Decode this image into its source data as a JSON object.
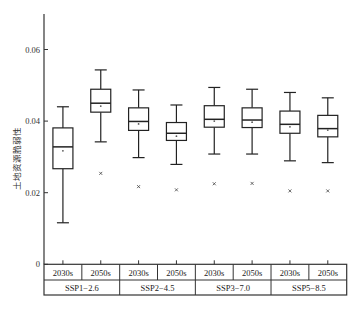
{
  "chart_data": {
    "type": "boxplot",
    "title": "",
    "xlabel": "",
    "ylabel": "土地资源脆弱性",
    "ylim": [
      0,
      0.07
    ],
    "yticks": [
      0,
      0.02,
      0.04,
      0.06
    ],
    "ytick_labels": [
      "0",
      "0.02",
      "0.04",
      "0.06"
    ],
    "grid": false,
    "legend": null,
    "groups": [
      "SSP1−2.6",
      "SSP2−4.5",
      "SSP3−7.0",
      "SSP5−8.5"
    ],
    "periods": [
      "2030s",
      "2050s"
    ],
    "boxes": [
      {
        "group": "SSP1−2.6",
        "period": "2030s",
        "min": 0.0116,
        "q1": 0.0267,
        "median": 0.0328,
        "mean": 0.0317,
        "q3": 0.0381,
        "max": 0.044,
        "outliers": []
      },
      {
        "group": "SSP1−2.6",
        "period": "2050s",
        "min": 0.0342,
        "q1": 0.0425,
        "median": 0.045,
        "mean": 0.0442,
        "q3": 0.0489,
        "max": 0.0543,
        "outliers": [
          0.0254
        ]
      },
      {
        "group": "SSP2−4.5",
        "period": "2030s",
        "min": 0.0298,
        "q1": 0.0374,
        "median": 0.0399,
        "mean": 0.0392,
        "q3": 0.0437,
        "max": 0.0487,
        "outliers": [
          0.0217
        ]
      },
      {
        "group": "SSP2−4.5",
        "period": "2050s",
        "min": 0.0279,
        "q1": 0.0346,
        "median": 0.0366,
        "mean": 0.0358,
        "q3": 0.0396,
        "max": 0.0445,
        "outliers": [
          0.0208
        ]
      },
      {
        "group": "SSP3−7.0",
        "period": "2030s",
        "min": 0.0308,
        "q1": 0.0383,
        "median": 0.0405,
        "mean": 0.04,
        "q3": 0.0443,
        "max": 0.0494,
        "outliers": [
          0.0225
        ]
      },
      {
        "group": "SSP3−7.0",
        "period": "2050s",
        "min": 0.0308,
        "q1": 0.0382,
        "median": 0.0403,
        "mean": 0.0397,
        "q3": 0.0437,
        "max": 0.0489,
        "outliers": [
          0.0226
        ]
      },
      {
        "group": "SSP5−8.5",
        "period": "2030s",
        "min": 0.0289,
        "q1": 0.0366,
        "median": 0.0391,
        "mean": 0.0384,
        "q3": 0.0428,
        "max": 0.048,
        "outliers": [
          0.0205
        ]
      },
      {
        "group": "SSP5−8.5",
        "period": "2050s",
        "min": 0.0284,
        "q1": 0.0356,
        "median": 0.0379,
        "mean": 0.0375,
        "q3": 0.0416,
        "max": 0.0465,
        "outliers": [
          0.0205
        ]
      }
    ]
  },
  "layout": {
    "axis_color": "#333333",
    "box_color": "#222222"
  }
}
